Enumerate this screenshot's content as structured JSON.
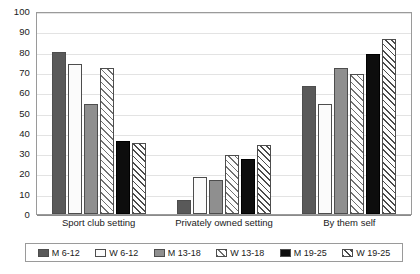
{
  "chart_data": {
    "type": "bar",
    "title": "",
    "xlabel": "",
    "ylabel": "",
    "ylim": [
      0,
      100
    ],
    "yticks": [
      0,
      10,
      20,
      30,
      40,
      50,
      60,
      70,
      80,
      90,
      100
    ],
    "grid": true,
    "legend_position": "bottom",
    "categories": [
      "Sport club setting",
      "Privately owned setting",
      "By them self"
    ],
    "series": [
      {
        "name": "M 6-12",
        "values": [
          80,
          7,
          63
        ],
        "color": "#595959",
        "pattern": "solid-dark-gray"
      },
      {
        "name": "W 6-12",
        "values": [
          74,
          18,
          54
        ],
        "color": "#fbfbfb",
        "pattern": "solid-white"
      },
      {
        "name": "M 13-18",
        "values": [
          54,
          17,
          72
        ],
        "color": "#8f8f8f",
        "pattern": "solid-medium-gray"
      },
      {
        "name": "W 13-18",
        "values": [
          72,
          29,
          69
        ],
        "color": "#fdfdfd",
        "pattern": "diagonal-hatch-light"
      },
      {
        "name": "M 19-25",
        "values": [
          36,
          27,
          79
        ],
        "color": "#0d0d0d",
        "pattern": "solid-black"
      },
      {
        "name": "W 19-25",
        "values": [
          35,
          34,
          86
        ],
        "color": "#fdfdfd",
        "pattern": "diagonal-hatch-dark"
      }
    ]
  },
  "axis": {
    "y_tick_labels": [
      "100",
      "90",
      "80",
      "70",
      "60",
      "50",
      "40",
      "30",
      "20",
      "10",
      "0"
    ]
  },
  "legend": {
    "items": [
      {
        "label": "M 6-12"
      },
      {
        "label": "W 6-12"
      },
      {
        "label": "M 13-18"
      },
      {
        "label": "W 13-18"
      },
      {
        "label": "M 19-25"
      },
      {
        "label": "W 19-25"
      }
    ]
  }
}
